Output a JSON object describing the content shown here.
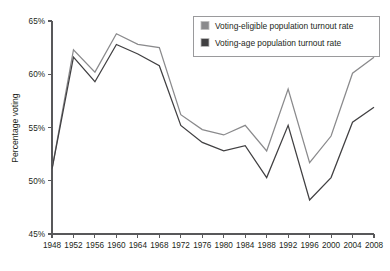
{
  "chart_data": {
    "type": "line",
    "title": "",
    "subtitle": "",
    "xlabel": "",
    "ylabel": "Percentage voting",
    "xlim": [
      1948,
      2008
    ],
    "ylim": [
      45,
      65
    ],
    "ytick_step": 5,
    "xtick_step": 4,
    "grid": false,
    "legend_position": "top-right",
    "x": [
      1948,
      1952,
      1956,
      1960,
      1964,
      1968,
      1972,
      1976,
      1980,
      1984,
      1988,
      1992,
      1996,
      2000,
      2004,
      2008
    ],
    "categories": [
      "1948",
      "1952",
      "1956",
      "1960",
      "1964",
      "1968",
      "1972",
      "1976",
      "1980",
      "1984",
      "1988",
      "1992",
      "1996",
      "2000",
      "2004",
      "2008"
    ],
    "ytick_labels": [
      "45%",
      "50%",
      "55%",
      "60%",
      "65%"
    ],
    "ytick_values": [
      45,
      50,
      55,
      60,
      65
    ],
    "series": [
      {
        "name": "Voting-eligible population turnout rate",
        "color": "#8a8a8c",
        "values": [
          51.1,
          62.3,
          60.2,
          63.8,
          62.8,
          62.5,
          56.2,
          54.8,
          54.3,
          55.2,
          52.8,
          58.6,
          51.7,
          54.2,
          60.1,
          61.6
        ]
      },
      {
        "name": "Voting-age population turnout rate",
        "color": "#414042",
        "values": [
          51.1,
          61.6,
          59.3,
          62.8,
          61.9,
          60.8,
          55.2,
          53.6,
          52.8,
          53.3,
          50.3,
          55.2,
          48.2,
          50.3,
          55.5,
          56.9
        ]
      }
    ]
  },
  "legend": {
    "entries": [
      {
        "label": "Voting-eligible population turnout rate",
        "swatch": "#8a8a8c"
      },
      {
        "label": "Voting-age population turnout rate",
        "swatch": "#414042"
      }
    ]
  },
  "axes": {
    "y_axis_title": "Percentage voting"
  }
}
